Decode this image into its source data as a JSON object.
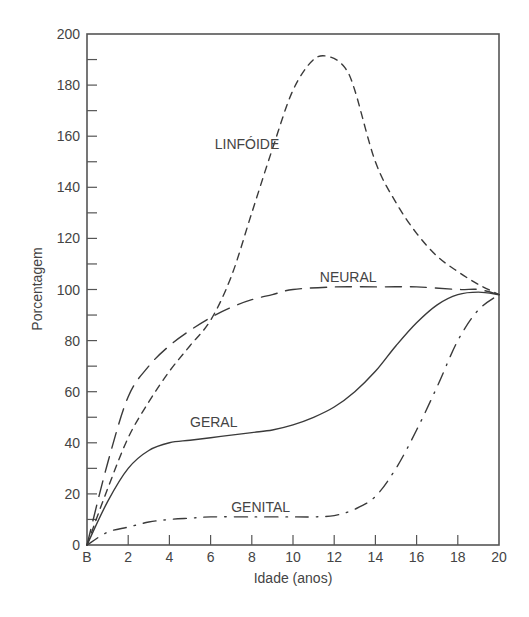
{
  "chart_data": {
    "type": "line",
    "title": "",
    "xlabel": "Idade (anos)",
    "ylabel": "Porcentagem",
    "xlim": [
      0,
      20
    ],
    "ylim": [
      0,
      200
    ],
    "grid": false,
    "legend": "inline labels on curves",
    "x_tick_labels": [
      "B",
      "2",
      "4",
      "6",
      "8",
      "10",
      "12",
      "14",
      "16",
      "18",
      "20"
    ],
    "y_tick_labels": [
      "0",
      "20",
      "40",
      "60",
      "80",
      "100",
      "120",
      "140",
      "160",
      "180",
      "200"
    ],
    "x": [
      0,
      2,
      4,
      6,
      8,
      10,
      12,
      14,
      16,
      18,
      20
    ],
    "series": [
      {
        "name": "LINFÓIDE",
        "style": "short-dash",
        "points": [
          [
            0,
            0
          ],
          [
            1,
            22
          ],
          [
            2,
            42
          ],
          [
            3,
            56
          ],
          [
            4,
            68
          ],
          [
            5,
            78
          ],
          [
            6,
            88
          ],
          [
            7,
            105
          ],
          [
            8,
            130
          ],
          [
            9,
            155
          ],
          [
            10,
            178
          ],
          [
            11,
            190
          ],
          [
            11.8,
            191
          ],
          [
            12.5,
            187
          ],
          [
            13,
            178
          ],
          [
            14,
            150
          ],
          [
            15,
            134
          ],
          [
            16,
            122
          ],
          [
            17,
            113
          ],
          [
            18,
            107
          ],
          [
            19,
            102
          ],
          [
            20,
            98
          ]
        ]
      },
      {
        "name": "NEURAL",
        "style": "long-dash",
        "points": [
          [
            0,
            0
          ],
          [
            1,
            32
          ],
          [
            2,
            58
          ],
          [
            3,
            70
          ],
          [
            4,
            78
          ],
          [
            5,
            84
          ],
          [
            6,
            89
          ],
          [
            7,
            93
          ],
          [
            8,
            96
          ],
          [
            9,
            98
          ],
          [
            10,
            100
          ],
          [
            12,
            101
          ],
          [
            14,
            101
          ],
          [
            16,
            101
          ],
          [
            18,
            100
          ],
          [
            19,
            100
          ],
          [
            20,
            98
          ]
        ]
      },
      {
        "name": "GERAL",
        "style": "solid",
        "points": [
          [
            0,
            0
          ],
          [
            1,
            17
          ],
          [
            2,
            30
          ],
          [
            3,
            37
          ],
          [
            4,
            40
          ],
          [
            5,
            41
          ],
          [
            6,
            42
          ],
          [
            7,
            43
          ],
          [
            8,
            44
          ],
          [
            9,
            45
          ],
          [
            10,
            47
          ],
          [
            11,
            50
          ],
          [
            12,
            54
          ],
          [
            13,
            60
          ],
          [
            14,
            68
          ],
          [
            15,
            78
          ],
          [
            16,
            87
          ],
          [
            17,
            94
          ],
          [
            18,
            98
          ],
          [
            19,
            99
          ],
          [
            20,
            98
          ]
        ]
      },
      {
        "name": "GENITAL",
        "style": "dash-dot",
        "points": [
          [
            0,
            0
          ],
          [
            1,
            5
          ],
          [
            2,
            7
          ],
          [
            3,
            9
          ],
          [
            4,
            10
          ],
          [
            5,
            10.5
          ],
          [
            6,
            11
          ],
          [
            8,
            11
          ],
          [
            10,
            11
          ],
          [
            11,
            11
          ],
          [
            12,
            11.5
          ],
          [
            13,
            14
          ],
          [
            14,
            19
          ],
          [
            15,
            30
          ],
          [
            16,
            45
          ],
          [
            17,
            62
          ],
          [
            18,
            80
          ],
          [
            19,
            92
          ],
          [
            20,
            98
          ]
        ]
      }
    ],
    "annotations": [
      {
        "text": "LINFÓIDE",
        "x": 6.2,
        "y": 155
      },
      {
        "text": "NEURAL",
        "x": 11.3,
        "y": 103
      },
      {
        "text": "GERAL",
        "x": 5.0,
        "y": 46
      },
      {
        "text": "GENITAL",
        "x": 7.0,
        "y": 13
      }
    ]
  }
}
